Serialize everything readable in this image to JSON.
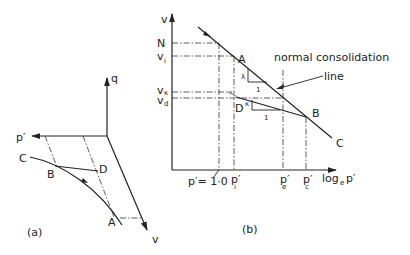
{
  "figure_a": {
    "caption": "(a)",
    "axes": {
      "q": "q",
      "p": "p′",
      "v": "v"
    },
    "points": {
      "A": "A",
      "B": "B",
      "C": "C",
      "D": "D"
    }
  },
  "figure_b": {
    "caption": "(b)",
    "axes": {
      "y": "v",
      "x": "log",
      "x_sub": "e",
      "x_p": "p′"
    },
    "y_ticks": {
      "N": "N",
      "vi": "v",
      "vi_sub": "i",
      "vk": "v",
      "vk_sub": "κ",
      "vd": "v",
      "vd_sub": "d"
    },
    "x_ticks": {
      "p1": "p′= 1·0",
      "pi": "p′",
      "pi_sub": "i",
      "pe": "p′",
      "pe_sub": "e",
      "pc": "p′",
      "pc_sub": "c"
    },
    "points": {
      "A": "A",
      "B": "B",
      "C": "C",
      "D": "D"
    },
    "slopes": {
      "lambda": "λ",
      "kappa": "κ",
      "one_ncl": "1",
      "one_url": "1"
    },
    "annotation": {
      "line1": "normal consolidation",
      "line2": "line"
    }
  }
}
